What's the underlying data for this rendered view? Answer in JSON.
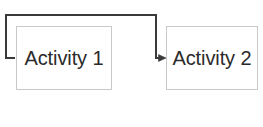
{
  "diagram": {
    "canvas": {
      "width": 263,
      "height": 127,
      "background_color": "#ffffff"
    },
    "nodes": [
      {
        "id": "activity-1",
        "label": "Activity 1",
        "shape": "rectangle",
        "border_color": "#c9c9c9",
        "fill_color": "#ffffff",
        "text_color": "#2b2b2b"
      },
      {
        "id": "activity-2",
        "label": "Activity 2",
        "shape": "rectangle",
        "border_color": "#c9c9c9",
        "fill_color": "#ffffff",
        "text_color": "#2b2b2b"
      }
    ],
    "connectors": [
      {
        "id": "feedback-connector",
        "from": "activity-1",
        "to": "activity-2",
        "label": "",
        "style": "orthogonal",
        "arrowhead": "open",
        "line_color": "#3a3a3a",
        "line_width": 2,
        "path": "M14,58 L6,58 L6,15 L156,15 L156,58 L166,58"
      }
    ]
  }
}
